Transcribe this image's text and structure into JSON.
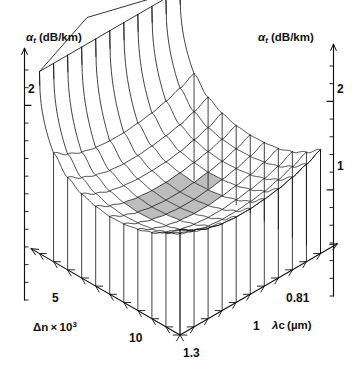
{
  "figure": {
    "kind": "3d-surface-mesh-plot",
    "background": "#ffffff",
    "line_color": "#111111",
    "shade_color": "#b7b7b7"
  },
  "axes": {
    "vertical_left": {
      "symbol": "α",
      "subscript": "t",
      "unit": "(dB/km)",
      "label": "αt (dB/km)",
      "ticks": [
        "2"
      ],
      "minor_tick_count": 13,
      "arrow": "up"
    },
    "vertical_right": {
      "symbol": "α",
      "subscript": "t",
      "unit": "(dB/km)",
      "label": "αt (dB/km)",
      "ticks": [
        "2",
        "1"
      ],
      "minor_tick_count": 13,
      "arrow": "up"
    },
    "depth_left": {
      "symbol": "Δn",
      "times": "×",
      "mantissa": "10",
      "exponent": "3",
      "label": "Δn × 10³",
      "ticks": [
        "5",
        "10"
      ],
      "arrow": "down-right"
    },
    "depth_right": {
      "symbol": "λc",
      "unit": "(μm)",
      "label": "λc (μm)",
      "ticks": [
        "1.3",
        "1",
        "0.81"
      ],
      "arrow": "up-right"
    }
  },
  "chart_data": {
    "type": "surface",
    "title": "",
    "xlabel": "λc (μm)",
    "ylabel": "Δn × 10³",
    "zlabel": "αt (dB/km)",
    "zlim": [
      0,
      2.6
    ],
    "z_ticks_labeled": [
      1,
      2
    ],
    "x_ticks_labeled": [
      1.3,
      1,
      0.81
    ],
    "y_ticks_labeled": [
      5,
      10
    ],
    "grid": true,
    "legend": false,
    "clipped_plateau": true,
    "clip_level": 2.6,
    "shaded_minimum_region": true,
    "shaded_region_note": "gray-filled mesh cells marking the minimum total attenuation valley",
    "nx": 11,
    "ny": 11,
    "x": [
      1.3,
      1.25,
      1.2,
      1.14,
      1.08,
      1.02,
      0.96,
      0.92,
      0.88,
      0.84,
      0.81
    ],
    "y": [
      3,
      3.7,
      4.4,
      5.1,
      5.8,
      6.5,
      7.2,
      7.9,
      8.6,
      9.3,
      10
    ],
    "z_rows": [
      [
        2.6,
        2.6,
        2.6,
        2.6,
        2.6,
        2.6,
        2.6,
        2.6,
        2.6,
        2.6,
        2.6
      ],
      [
        1.55,
        1.42,
        1.33,
        1.28,
        1.26,
        1.26,
        1.28,
        1.31,
        1.36,
        1.43,
        1.52
      ],
      [
        1.32,
        1.2,
        1.12,
        1.07,
        1.05,
        1.05,
        1.07,
        1.1,
        1.14,
        1.21,
        1.3
      ],
      [
        1.2,
        1.09,
        1.01,
        0.97,
        0.95,
        0.95,
        0.96,
        0.99,
        1.04,
        1.1,
        1.19
      ],
      [
        1.14,
        1.03,
        0.96,
        0.92,
        0.9,
        0.9,
        0.92,
        0.95,
        0.99,
        1.05,
        1.13
      ],
      [
        1.11,
        1.01,
        0.94,
        0.9,
        0.88,
        0.88,
        0.9,
        0.93,
        0.97,
        1.03,
        1.11
      ],
      [
        1.12,
        1.02,
        0.95,
        0.91,
        0.89,
        0.89,
        0.91,
        0.94,
        0.98,
        1.04,
        1.12
      ],
      [
        1.16,
        1.05,
        0.98,
        0.94,
        0.92,
        0.92,
        0.94,
        0.97,
        1.01,
        1.07,
        1.15
      ],
      [
        1.23,
        1.12,
        1.04,
        1.0,
        0.98,
        0.98,
        1.0,
        1.03,
        1.07,
        1.13,
        1.22
      ],
      [
        1.34,
        1.22,
        1.14,
        1.09,
        1.07,
        1.07,
        1.09,
        1.12,
        1.17,
        1.24,
        1.33
      ],
      [
        1.5,
        1.38,
        1.29,
        1.24,
        1.22,
        1.22,
        1.24,
        1.27,
        1.32,
        1.39,
        1.48
      ]
    ]
  }
}
